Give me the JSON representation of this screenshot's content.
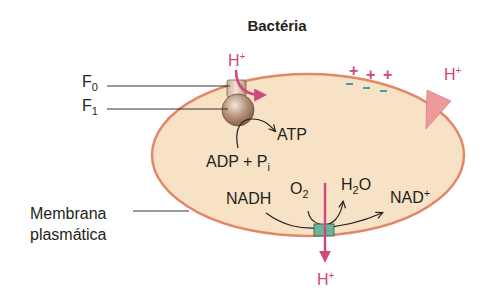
{
  "title": "Bactéria",
  "colors": {
    "cell_fill": "#f7e2c6",
    "membrane": "#e2876a",
    "proton": "#d1477a",
    "charge_minus": "#3aa3a8",
    "complex": "#6fb39a",
    "atp_synthase": "#a07d62",
    "text": "#231f20"
  },
  "labels": {
    "f0": {
      "base": "F",
      "sub": "0"
    },
    "f1": {
      "base": "F",
      "sub": "1"
    },
    "atp": "ATP",
    "adp_pi": {
      "base": "ADP + P",
      "sub": "i"
    },
    "nadh": "NADH",
    "o2": {
      "base": "O",
      "sub": "2"
    },
    "h2o": {
      "base": "H",
      "sub": "2",
      "tail": "O"
    },
    "nad_plus": {
      "base": "NAD",
      "sup": "+"
    },
    "membrane": [
      "Membrana",
      "plasmática"
    ]
  },
  "protons": {
    "top": {
      "base": "H",
      "sup": "+"
    },
    "right": {
      "base": "H",
      "sup": "+"
    },
    "bottom": {
      "base": "H",
      "sup": "+"
    }
  },
  "charges": {
    "plus": [
      "+",
      "+",
      "+"
    ],
    "minus": [
      "–",
      "–",
      "–"
    ]
  }
}
